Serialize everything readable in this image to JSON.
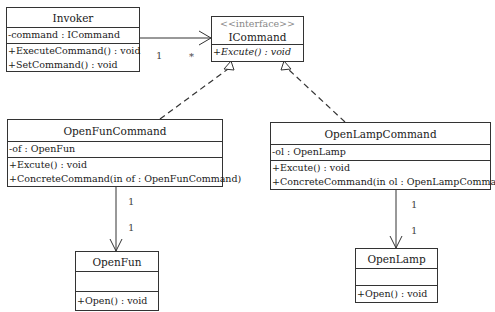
{
  "classes": {
    "invoker": {
      "name": "Invoker",
      "attributes": [
        "-command : ICommand"
      ],
      "operations": [
        "+ExecuteCommand() : void",
        "+SetCommand() : void"
      ]
    },
    "icommand": {
      "stereotype": "<<interface>>",
      "name": "ICommand",
      "operations": [
        "+Excute() : void"
      ]
    },
    "openfuncommand": {
      "name": "OpenFunCommand",
      "attributes": [
        "-of : OpenFun"
      ],
      "operations": [
        "+Excute() : void",
        "+ConcreteCommand(in of : OpenFunCommand)"
      ]
    },
    "openlampcommand": {
      "name": "OpenLampCommand",
      "attributes": [
        "-ol : OpenLamp"
      ],
      "operations": [
        "+Excute() : void",
        "+ConcreteCommand(in ol : OpenLampCommand)"
      ]
    },
    "openfun": {
      "name": "OpenFun",
      "attributes": [],
      "operations": [
        "+Open() : void"
      ]
    },
    "openlamp": {
      "name": "OpenLamp",
      "attributes": [],
      "operations": [
        "+Open() : void"
      ]
    }
  },
  "relations": {
    "invoker_icommand": {
      "type": "association",
      "source_mult": "1",
      "target_mult": "*"
    },
    "openfuncommand_icommand": {
      "type": "realization"
    },
    "openlampcommand_icommand": {
      "type": "realization"
    },
    "openfuncommand_openfun": {
      "type": "association",
      "source_mult": "1",
      "target_mult": "1"
    },
    "openlampcommand_openlamp": {
      "type": "association",
      "source_mult": "1",
      "target_mult": "1"
    }
  }
}
